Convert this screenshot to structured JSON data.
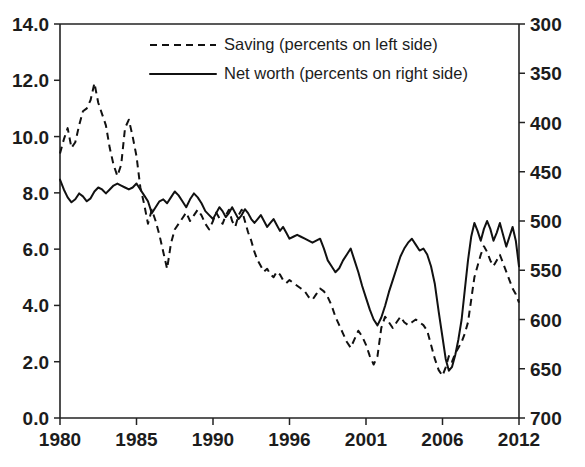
{
  "chart_title": "",
  "legend": [
    {
      "key": "saving",
      "label": "Saving (percents on left side)",
      "style": "dashed"
    },
    {
      "key": "networth",
      "label": "Net worth (percents on right side)",
      "style": "solid"
    }
  ],
  "axes": {
    "left": {
      "ticks": [
        "0.0",
        "2.0",
        "4.0",
        "6.0",
        "8.0",
        "10.0",
        "12.0",
        "14.0"
      ],
      "min": 0,
      "max": 14,
      "step": 2
    },
    "right": {
      "ticks": [
        "300",
        "350",
        "400",
        "450",
        "500",
        "550",
        "600",
        "650",
        "700"
      ],
      "min": 300,
      "max": 700,
      "step": 50,
      "inverted": true
    },
    "x": {
      "ticks": [
        "1980",
        "1985",
        "1990",
        "1996",
        "2001",
        "2006",
        "2012"
      ],
      "min": 1980,
      "max": 2012
    }
  },
  "colors": {
    "line": "#111111",
    "axis": "#222222",
    "background": "#ffffff"
  },
  "chart_data": {
    "type": "line",
    "title": "",
    "xlabel": "",
    "ylabel": "",
    "y2label": "",
    "xlim": [
      1980,
      2012
    ],
    "ylim": [
      0,
      14
    ],
    "y2lim": [
      700,
      300
    ],
    "grid": false,
    "legend_position": "top-center",
    "xticks": [
      1980,
      1985,
      1990,
      1996,
      2001,
      2006,
      2012
    ],
    "yticks": [
      0,
      2,
      4,
      6,
      8,
      10,
      12,
      14
    ],
    "y2ticks": [
      300,
      350,
      400,
      450,
      500,
      550,
      600,
      650,
      700
    ],
    "series": [
      {
        "name": "Saving (percents on left side)",
        "axis": "left",
        "style": "dashed",
        "x": [
          1980.0,
          1980.25,
          1980.5,
          1980.75,
          1981.0,
          1981.25,
          1981.5,
          1981.75,
          1982.0,
          1982.25,
          1982.5,
          1982.75,
          1983.0,
          1983.25,
          1983.5,
          1983.75,
          1984.0,
          1984.25,
          1984.5,
          1984.75,
          1985.0,
          1985.25,
          1985.5,
          1985.75,
          1986.0,
          1986.25,
          1986.5,
          1986.75,
          1987.0,
          1987.25,
          1987.5,
          1987.75,
          1988.0,
          1988.25,
          1988.5,
          1988.75,
          1989.0,
          1989.25,
          1989.5,
          1989.75,
          1990.0,
          1990.25,
          1990.5,
          1990.75,
          1991.0,
          1991.25,
          1991.5,
          1991.75,
          1992.0,
          1992.25,
          1992.5,
          1992.75,
          1993.0,
          1993.25,
          1993.5,
          1993.75,
          1994.0,
          1994.25,
          1994.5,
          1994.75,
          1995.0,
          1995.25,
          1995.5,
          1995.75,
          1996.0,
          1996.25,
          1996.5,
          1996.75,
          1997.0,
          1997.25,
          1997.5,
          1997.75,
          1998.0,
          1998.25,
          1998.5,
          1998.75,
          1999.0,
          1999.25,
          1999.5,
          1999.75,
          2000.0,
          2000.25,
          2000.5,
          2000.75,
          2001.0,
          2001.25,
          2001.5,
          2001.75,
          2002.0,
          2002.25,
          2002.5,
          2002.75,
          2003.0,
          2003.25,
          2003.5,
          2003.75,
          2004.0,
          2004.25,
          2004.5,
          2004.75,
          2005.0,
          2005.25,
          2005.5,
          2005.75,
          2006.0,
          2006.25,
          2006.5,
          2006.75,
          2007.0,
          2007.25,
          2007.5,
          2007.75,
          2008.0,
          2008.25,
          2008.5,
          2008.75,
          2009.0,
          2009.25,
          2009.5,
          2009.75,
          2010.0,
          2010.25,
          2010.5,
          2010.75,
          2011.0,
          2011.25,
          2011.5,
          2011.75,
          2012.0
        ],
        "y": [
          9.4,
          9.9,
          10.3,
          9.6,
          9.8,
          10.4,
          10.9,
          11.0,
          11.3,
          11.9,
          11.2,
          10.8,
          10.4,
          9.6,
          9.0,
          8.6,
          9.0,
          10.3,
          10.6,
          10.0,
          9.3,
          8.2,
          7.6,
          6.9,
          7.4,
          7.0,
          6.5,
          5.9,
          5.3,
          6.2,
          6.7,
          6.9,
          7.1,
          7.3,
          7.0,
          7.2,
          7.4,
          7.2,
          6.9,
          6.7,
          7.0,
          7.3,
          7.1,
          6.9,
          7.2,
          7.4,
          7.0,
          6.8,
          7.2,
          7.4,
          7.0,
          6.6,
          6.3,
          5.9,
          5.6,
          5.4,
          5.2,
          5.3,
          5.1,
          5.0,
          5.2,
          5.1,
          4.9,
          4.8,
          4.9,
          4.8,
          4.7,
          4.6,
          4.5,
          4.3,
          4.2,
          4.4,
          4.6,
          4.5,
          4.3,
          4.0,
          3.6,
          3.3,
          3.0,
          2.7,
          2.5,
          2.8,
          3.1,
          2.9,
          2.6,
          2.2,
          1.9,
          2.2,
          3.2,
          3.6,
          3.4,
          3.2,
          3.4,
          3.6,
          3.4,
          3.3,
          3.4,
          3.5,
          3.4,
          3.3,
          3.1,
          2.6,
          2.1,
          1.7,
          1.5,
          1.8,
          2.2,
          2.0,
          2.3,
          2.5,
          2.7,
          3.0,
          3.4,
          4.2,
          5.0,
          5.4,
          5.8,
          6.1,
          5.9,
          5.6,
          5.4,
          5.6,
          5.8,
          5.5,
          5.2,
          4.9,
          4.6,
          4.4,
          4.1
        ]
      },
      {
        "name": "Net worth (percents on right side)",
        "axis": "right",
        "style": "solid",
        "x": [
          1980.0,
          1980.25,
          1980.5,
          1980.75,
          1981.0,
          1981.25,
          1981.5,
          1981.75,
          1982.0,
          1982.25,
          1982.5,
          1982.75,
          1983.0,
          1983.25,
          1983.5,
          1983.75,
          1984.0,
          1984.25,
          1984.5,
          1984.75,
          1985.0,
          1985.25,
          1985.5,
          1985.75,
          1986.0,
          1986.25,
          1986.5,
          1986.75,
          1987.0,
          1987.25,
          1987.5,
          1987.75,
          1988.0,
          1988.25,
          1988.5,
          1988.75,
          1989.0,
          1989.25,
          1989.5,
          1989.75,
          1990.0,
          1990.25,
          1990.5,
          1990.75,
          1991.0,
          1991.25,
          1991.5,
          1991.75,
          1992.0,
          1992.25,
          1992.5,
          1992.75,
          1993.0,
          1993.25,
          1993.5,
          1993.75,
          1994.0,
          1994.25,
          1994.5,
          1994.75,
          1995.0,
          1995.25,
          1995.5,
          1995.75,
          1996.0,
          1996.25,
          1996.5,
          1996.75,
          1997.0,
          1997.25,
          1997.5,
          1997.75,
          1998.0,
          1998.25,
          1998.5,
          1998.75,
          1999.0,
          1999.25,
          1999.5,
          1999.75,
          2000.0,
          2000.25,
          2000.5,
          2000.75,
          2001.0,
          2001.25,
          2001.5,
          2001.75,
          2002.0,
          2002.25,
          2002.5,
          2002.75,
          2003.0,
          2003.25,
          2003.5,
          2003.75,
          2004.0,
          2004.25,
          2004.5,
          2004.75,
          2005.0,
          2005.25,
          2005.5,
          2005.75,
          2006.0,
          2006.25,
          2006.5,
          2006.75,
          2007.0,
          2007.25,
          2007.5,
          2007.75,
          2008.0,
          2008.25,
          2008.5,
          2008.75,
          2009.0,
          2009.25,
          2009.5,
          2009.75,
          2010.0,
          2010.25,
          2010.5,
          2010.75,
          2011.0,
          2011.25,
          2011.5,
          2011.75,
          2012.0
        ],
        "y": [
          458,
          468,
          476,
          481,
          478,
          472,
          475,
          480,
          477,
          470,
          466,
          468,
          472,
          468,
          464,
          462,
          464,
          466,
          468,
          466,
          462,
          468,
          474,
          480,
          492,
          486,
          480,
          478,
          482,
          476,
          470,
          474,
          480,
          486,
          478,
          472,
          476,
          482,
          490,
          494,
          498,
          492,
          486,
          490,
          496,
          492,
          486,
          492,
          498,
          494,
          488,
          492,
          498,
          502,
          498,
          494,
          500,
          506,
          502,
          498,
          504,
          510,
          506,
          512,
          518,
          516,
          514,
          516,
          518,
          520,
          522,
          520,
          518,
          528,
          540,
          546,
          552,
          548,
          540,
          534,
          528,
          540,
          552,
          566,
          578,
          590,
          600,
          606,
          598,
          586,
          572,
          560,
          548,
          536,
          528,
          522,
          518,
          524,
          530,
          528,
          534,
          546,
          564,
          592,
          618,
          640,
          652,
          648,
          636,
          620,
          600,
          570,
          540,
          516,
          502,
          510,
          520,
          508,
          500,
          508,
          520,
          512,
          502,
          514,
          526,
          516,
          506,
          520,
          546
        ]
      }
    ]
  }
}
